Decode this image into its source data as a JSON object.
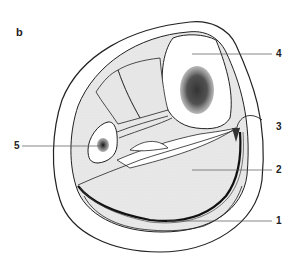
{
  "figure": {
    "panel_label": "b",
    "labels": [
      {
        "id": "1",
        "text": "1",
        "x": 276,
        "y": 213
      },
      {
        "id": "2",
        "text": "2",
        "x": 276,
        "y": 165
      },
      {
        "id": "3",
        "text": "3",
        "x": 276,
        "y": 122
      },
      {
        "id": "4",
        "text": "4",
        "x": 276,
        "y": 52
      },
      {
        "id": "5",
        "text": "5",
        "x": 14,
        "y": 142
      }
    ],
    "colors": {
      "outline": "#222222",
      "muscle_fill": "#e6e6e6",
      "leader": "#555555",
      "marrow": "#333333"
    }
  }
}
